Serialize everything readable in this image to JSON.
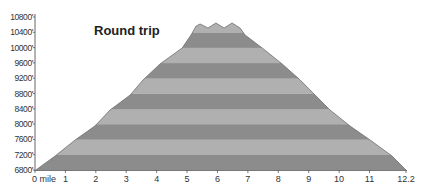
{
  "chart_data": {
    "type": "area",
    "title": "Round trip",
    "xlabel": "",
    "ylabel": "",
    "x_unit_label": "mile",
    "xlim": [
      0,
      12.2
    ],
    "ylim": [
      6800,
      10800
    ],
    "x_ticks": [
      0,
      1,
      2,
      3,
      4,
      5,
      6,
      7,
      8,
      9,
      10,
      11,
      12.2
    ],
    "x_tick_labels": [
      "0 mile",
      "1",
      "2",
      "3",
      "4",
      "5",
      "6",
      "7",
      "8",
      "9",
      "10",
      "11",
      "12.2"
    ],
    "y_ticks": [
      6800,
      7200,
      7600,
      8000,
      8400,
      8800,
      9200,
      9600,
      10000,
      10400,
      10800
    ],
    "y_tick_labels": [
      "6800'",
      "7200'",
      "7600'",
      "8000'",
      "8400'",
      "8800'",
      "9200'",
      "9600'",
      "10000'",
      "10400'",
      "10800'"
    ],
    "grid": false,
    "legend": null,
    "band_interval": 400,
    "band_colors": {
      "dark": "#8c8c8c",
      "light": "#b0b0b0",
      "outline": "#6e6e6e"
    },
    "series": [
      {
        "name": "Elevation profile",
        "x": [
          0.03,
          0.66,
          1.32,
          1.97,
          2.47,
          3.13,
          3.55,
          4.11,
          4.84,
          5.13,
          5.3,
          5.43,
          5.69,
          5.95,
          6.22,
          6.48,
          6.74,
          6.91,
          7.47,
          8.13,
          8.72,
          9.21,
          9.7,
          10.36,
          11.02,
          11.74,
          12.2
        ],
        "values": [
          6800,
          7166,
          7584,
          7950,
          8369,
          8761,
          9153,
          9571,
          9990,
          10330,
          10565,
          10617,
          10512,
          10643,
          10512,
          10643,
          10512,
          10330,
          9990,
          9571,
          9153,
          8761,
          8369,
          7950,
          7584,
          7166,
          6800
        ]
      }
    ]
  }
}
